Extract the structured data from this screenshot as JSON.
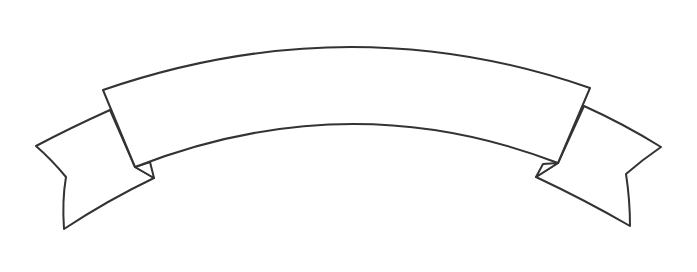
{
  "image": {
    "description": "Blank curved ribbon banner line-art",
    "width": 697,
    "height": 272
  },
  "banner": {
    "text": "",
    "stroke_color": "#333333",
    "fill_color": "#ffffff",
    "background_color": "#ffffff"
  }
}
